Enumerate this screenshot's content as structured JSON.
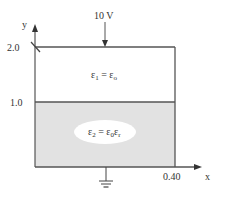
{
  "diagram": {
    "voltage_label": "10 V",
    "axes": {
      "y_label": "y",
      "x_label": "x",
      "y_ticks": [
        "2.0",
        "1.0"
      ],
      "x_ticks": [
        "0.40"
      ]
    },
    "regions": [
      {
        "name": "upper",
        "label_lhs": "ε",
        "label_lhs_sub": "1",
        "label_eq": " = ",
        "label_rhs": "ε",
        "label_rhs_sub": "o",
        "label_rhs2": "",
        "label_rhs2_sub": ""
      },
      {
        "name": "lower",
        "label_lhs": "ε",
        "label_lhs_sub": "2",
        "label_eq": " = ",
        "label_rhs": "ε",
        "label_rhs_sub": "0",
        "label_rhs2": "ε",
        "label_rhs2_sub": "r"
      }
    ],
    "colors": {
      "line": "#555555",
      "lower_fill": "#e2e2e2",
      "ellipse_fill": "#ffffff",
      "text": "#333333"
    }
  }
}
